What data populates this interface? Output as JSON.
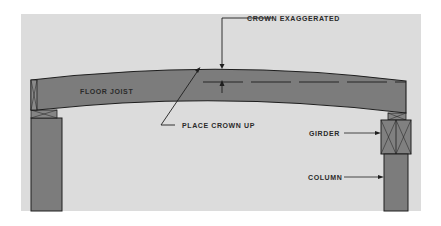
{
  "diagram": {
    "colors": {
      "page_bg": "#ffffff",
      "panel_bg": "#dcdcdc",
      "member_fill": "#7c7c7c",
      "outline": "#1e1e1e",
      "text": "#2a2a2a"
    },
    "labels": {
      "floor_joist": "FLOOR JOIST",
      "crown_exaggerated": "CROWN EXAGGERATED",
      "place_crown_up": "PLACE CROWN UP",
      "girder": "GIRDER",
      "column": "COLUMN"
    },
    "elements": [
      {
        "name": "floor-joist",
        "kind": "curved beam"
      },
      {
        "name": "left-bearing-block",
        "kind": "blocking"
      },
      {
        "name": "left-column",
        "kind": "column"
      },
      {
        "name": "girder",
        "kind": "beam section"
      },
      {
        "name": "right-column",
        "kind": "column"
      }
    ]
  }
}
